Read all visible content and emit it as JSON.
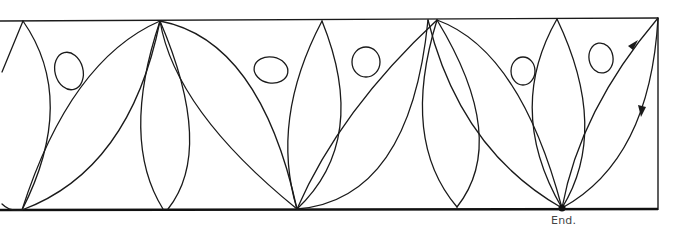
{
  "diagram": {
    "type": "continuous-line-drawing",
    "end_label": "End.",
    "end_point": {
      "x": 562,
      "y": 208
    },
    "direction_arrows": [
      {
        "x": 633,
        "y": 46,
        "direction": "up-right"
      },
      {
        "x": 643,
        "y": 110,
        "direction": "down"
      }
    ],
    "frame": {
      "top_y": 20,
      "bottom_y": 210,
      "right_x": 658
    },
    "colors": {
      "stroke": "#1a1a1a",
      "background": "#ffffff",
      "label": "#444444"
    }
  }
}
